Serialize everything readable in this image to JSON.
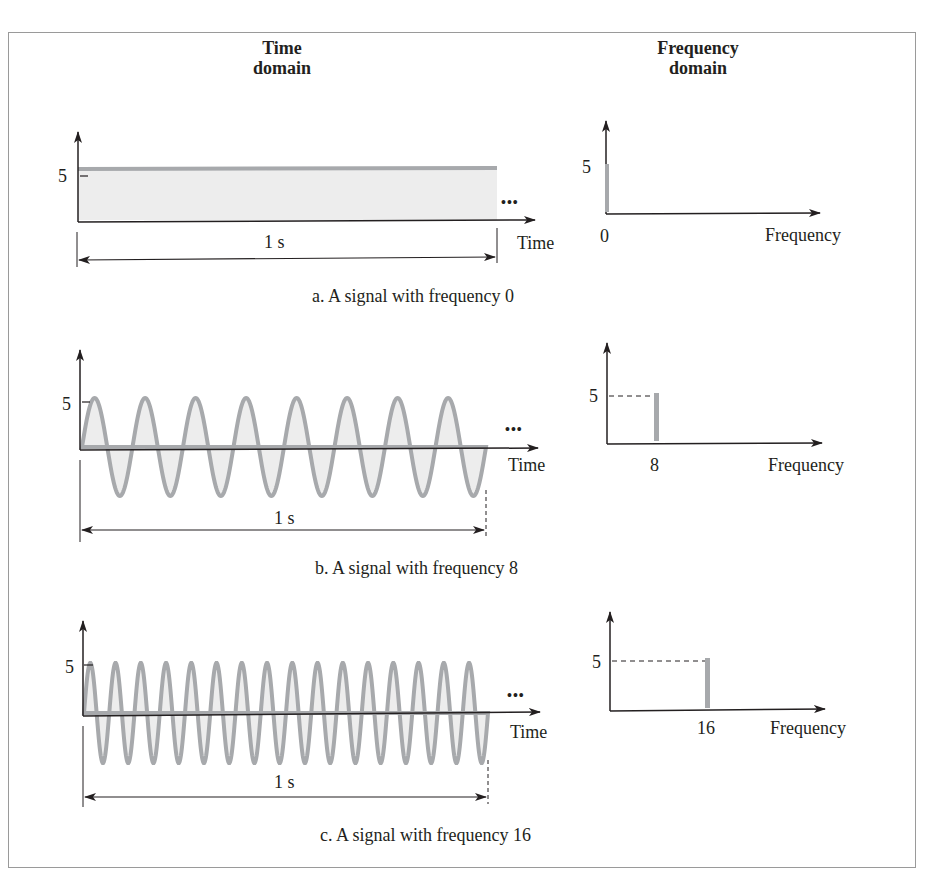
{
  "headers": {
    "time_domain": [
      "Time",
      "domain"
    ],
    "frequency_domain": [
      "Frequency",
      "domain"
    ]
  },
  "panels": [
    {
      "id": "a",
      "caption": "a. A signal with frequency 0",
      "time_axis_label": "Time",
      "freq_axis_label": "Frequency",
      "amplitude_label": "5",
      "duration_label": "1 s",
      "ellipsis": "•••",
      "freq_tick_label": "0"
    },
    {
      "id": "b",
      "caption": "b. A signal with frequency 8",
      "time_axis_label": "Time",
      "freq_axis_label": "Frequency",
      "amplitude_label": "5",
      "duration_label": "1 s",
      "ellipsis": "•••",
      "freq_tick_label": "8"
    },
    {
      "id": "c",
      "caption": "c. A signal with frequency 16",
      "time_axis_label": "Time",
      "freq_axis_label": "Frequency",
      "amplitude_label": "5",
      "duration_label": "1 s",
      "ellipsis": "•••",
      "freq_tick_label": "16"
    }
  ],
  "colors": {
    "signal_stroke": "#a7a9ac",
    "signal_fill": "#ededed",
    "axis": "#231f20",
    "frame": "#9a9a9a"
  },
  "chart_data": [
    {
      "type": "line",
      "title": "a. A signal with frequency 0",
      "xlabel": "Time",
      "ylabel": "",
      "frequency_hz": 0,
      "amplitude": 5,
      "duration_s": 1,
      "time_domain": {
        "x": [
          0,
          1
        ],
        "y": [
          5,
          5
        ]
      },
      "frequency_domain": {
        "type": "bar",
        "categories": [
          "0"
        ],
        "values": [
          5
        ]
      }
    },
    {
      "type": "line",
      "title": "b. A signal with frequency 8",
      "xlabel": "Time",
      "ylabel": "",
      "frequency_hz": 8,
      "amplitude": 5,
      "duration_s": 1,
      "cycles_shown": 8,
      "time_domain": {
        "function": "5*sin(2*pi*8*t)",
        "x_range": [
          0,
          1
        ]
      },
      "frequency_domain": {
        "type": "bar",
        "categories": [
          "8"
        ],
        "values": [
          5
        ]
      }
    },
    {
      "type": "line",
      "title": "c. A signal with frequency 16",
      "xlabel": "Time",
      "ylabel": "",
      "frequency_hz": 16,
      "amplitude": 5,
      "duration_s": 1,
      "cycles_shown": 16,
      "time_domain": {
        "function": "5*sin(2*pi*16*t)",
        "x_range": [
          0,
          1
        ]
      },
      "frequency_domain": {
        "type": "bar",
        "categories": [
          "16"
        ],
        "values": [
          5
        ]
      }
    }
  ]
}
